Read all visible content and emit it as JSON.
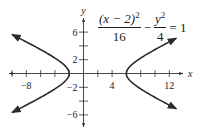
{
  "chart_data": {
    "type": "line",
    "title": "",
    "equation": {
      "num1": "(x − 2)",
      "num1_exp": "2",
      "den1": "16",
      "minus": "−",
      "num2": "y",
      "num2_exp": "2",
      "den2": "4",
      "rhs": "= 1",
      "text": "(x-2)^2/16 - y^2/4 = 1"
    },
    "xlabel": "x",
    "ylabel": "y",
    "xlim": [
      -11,
      15
    ],
    "ylim": [
      -7,
      8
    ],
    "x_ticks": [
      -10,
      -8,
      -6,
      -4,
      -2,
      2,
      4,
      6,
      8,
      10,
      12
    ],
    "x_tick_labels": [
      {
        "value": -8,
        "label": "−8"
      },
      {
        "value": 4,
        "label": "4"
      },
      {
        "value": 12,
        "label": "12"
      }
    ],
    "y_ticks": [
      -6,
      -4,
      -2,
      2,
      4,
      6
    ],
    "y_tick_labels": [
      {
        "value": 6,
        "label": "6"
      },
      {
        "value": 2,
        "label": "2"
      },
      {
        "value": -2,
        "label": "−2"
      },
      {
        "value": -6,
        "label": "−6"
      }
    ],
    "grid": false,
    "legend": null,
    "series": [
      {
        "name": "left branch",
        "center": [
          2,
          0
        ],
        "a": 4,
        "b": 2,
        "vertex": [
          -2,
          0
        ],
        "x_range": [
          -10,
          -2
        ],
        "arrows": true
      },
      {
        "name": "right branch",
        "center": [
          2,
          0
        ],
        "a": 4,
        "b": 2,
        "vertex": [
          6,
          0
        ],
        "x_range": [
          6,
          13
        ],
        "arrows": true
      }
    ],
    "colors": {
      "curve": "#2a2a2a",
      "axis": "#333333"
    }
  }
}
